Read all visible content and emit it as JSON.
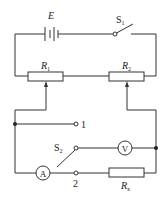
{
  "diagram": {
    "type": "circuit-schematic",
    "components": {
      "battery": {
        "label": "E"
      },
      "switch_1": {
        "label": "S",
        "subscript": "1"
      },
      "rheostat_1": {
        "label": "R",
        "subscript": "1"
      },
      "rheostat_2": {
        "label": "R",
        "subscript": "2"
      },
      "switch_2": {
        "label": "S",
        "subscript": "2"
      },
      "voltmeter": {
        "label": "V"
      },
      "ammeter": {
        "label": "A"
      },
      "resistor_x": {
        "label": "R",
        "subscript": "x"
      },
      "terminal_1": {
        "label": "1"
      },
      "terminal_2": {
        "label": "2"
      }
    },
    "colors": {
      "line": "#333333",
      "background": "#ffffff"
    }
  }
}
